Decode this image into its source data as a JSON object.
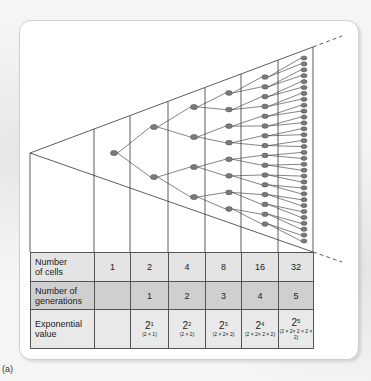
{
  "figure": {
    "caption": "(a)",
    "table": {
      "rows": [
        {
          "label": "Number of cells",
          "label_lines": [
            "Number",
            "of cells"
          ],
          "values": [
            "1",
            "2",
            "4",
            "8",
            "16",
            "32"
          ]
        },
        {
          "label": "Number of generations",
          "label_lines": [
            "Number of",
            "generations"
          ],
          "values": [
            "",
            "1",
            "2",
            "3",
            "4",
            "5"
          ]
        },
        {
          "label": "Exponential value",
          "label_lines": [
            "Exponential",
            "value"
          ],
          "values": [
            {
              "base": "",
              "exp": "",
              "expansion": ""
            },
            {
              "base": "2",
              "exp": "1",
              "expansion": "(2 × 1)"
            },
            {
              "base": "2",
              "exp": "2",
              "expansion": "(2 × 2)"
            },
            {
              "base": "2",
              "exp": "3",
              "expansion": "(2 × 2× 2)"
            },
            {
              "base": "2",
              "exp": "4",
              "expansion": "(2 × 2× 2 × 2)"
            },
            {
              "base": "2",
              "exp": "5",
              "expansion": "(2 × 2× 2 × 2 × 2)"
            }
          ]
        }
      ]
    },
    "tree": {
      "generations": 5,
      "cells_per_generation": [
        1,
        2,
        4,
        8,
        16,
        32
      ],
      "node_color": "#7a7a7a",
      "line_color": "#333333"
    }
  }
}
